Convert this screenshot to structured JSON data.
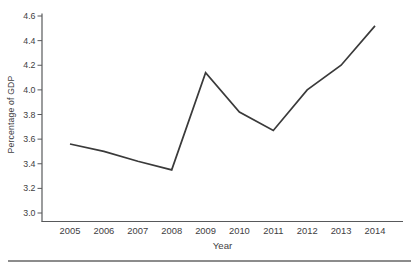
{
  "figure": {
    "background": "#ffffff"
  },
  "chart_data": {
    "type": "line",
    "title": "",
    "xlabel": "Year",
    "ylabel": "Percentage of GDP",
    "categories": [
      "2005",
      "2006",
      "2007",
      "2008",
      "2009",
      "2010",
      "2011",
      "2012",
      "2013",
      "2014"
    ],
    "series": [
      {
        "name": "Percentage of GDP",
        "values": [
          3.56,
          3.5,
          3.42,
          3.35,
          4.14,
          3.82,
          3.67,
          4.0,
          4.2,
          4.52
        ]
      }
    ],
    "ylim": [
      3.0,
      4.6
    ],
    "ytick_step": 0.2,
    "yticks": [
      "3.0",
      "3.2",
      "3.4",
      "3.6",
      "3.8",
      "4.0",
      "4.2",
      "4.4",
      "4.6"
    ],
    "grid": false,
    "legend": "none",
    "line_color": "#3a3a3a",
    "axis_color": "#58595b",
    "text_color": "#414042",
    "separator_color": "#8c8c8c"
  }
}
